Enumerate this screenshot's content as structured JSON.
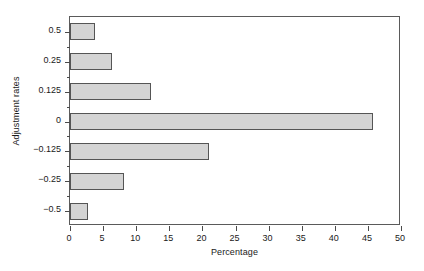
{
  "chart_data": {
    "type": "bar",
    "orientation": "horizontal",
    "title": "",
    "xlabel": "Percentage",
    "ylabel": "Adjustment rates",
    "categories": [
      "0.5",
      "0.25",
      "0.125",
      "0",
      "−0.125",
      "−0.25",
      "−0.5"
    ],
    "values": [
      3.8,
      6.3,
      12.3,
      45.8,
      21.0,
      8.2,
      2.7
    ],
    "xlim": [
      0,
      50
    ],
    "xticks": [
      "0",
      "5",
      "10",
      "15",
      "20",
      "25",
      "30",
      "35",
      "40",
      "45",
      "50"
    ],
    "xtick_values": [
      0,
      5,
      10,
      15,
      20,
      25,
      30,
      35,
      40,
      45,
      50
    ],
    "grid": false,
    "legend": null,
    "bar_fill_color": "#d4d4d4",
    "bar_border_color": "#555555",
    "axis_color": "#5a5a5a",
    "background_color": "#ffffff",
    "minor_ticks_between_categories": true
  }
}
